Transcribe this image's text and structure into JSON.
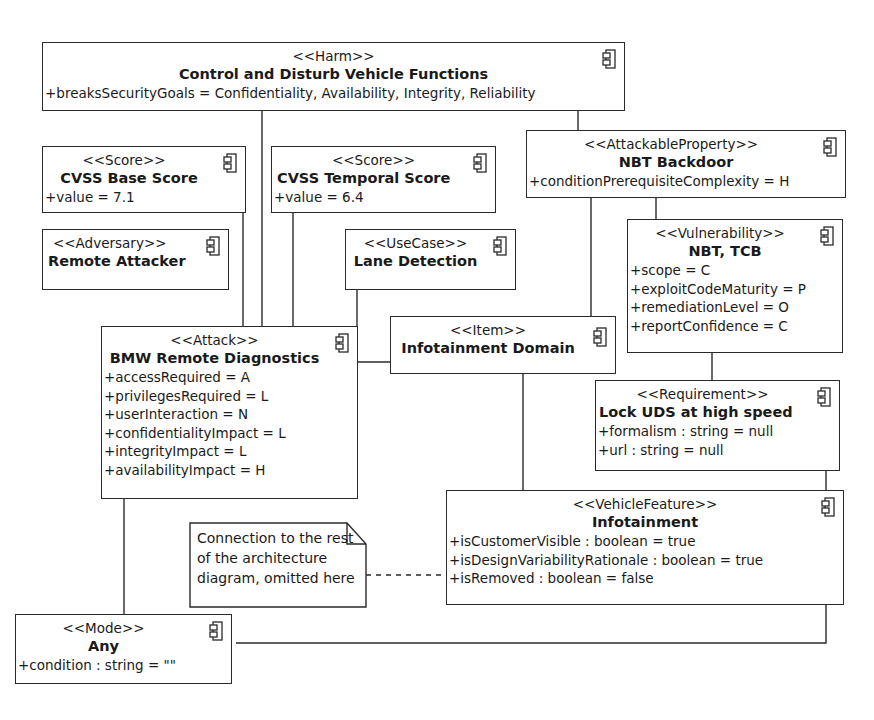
{
  "diagram": {
    "type": "UML component diagram (security / threat model)",
    "elements": {
      "harm": {
        "stereotype": "<<Harm>>",
        "name": "Control and Disturb Vehicle Functions",
        "attributes": [
          "+breaksSecurityGoals = Confidentiality, Availability, Integrity, Reliability"
        ]
      },
      "base_score": {
        "stereotype": "<<Score>>",
        "name": "CVSS Base Score",
        "attributes": [
          "+value = 7.1"
        ]
      },
      "temporal_score": {
        "stereotype": "<<Score>>",
        "name": "CVSS Temporal Score",
        "attributes": [
          "+value = 6.4"
        ]
      },
      "attackable_property": {
        "stereotype": "<<AttackableProperty>>",
        "name": "NBT Backdoor",
        "attributes": [
          "+conditionPrerequisiteComplexity = H"
        ]
      },
      "adversary": {
        "stereotype": "<<Adversary>>",
        "name": "Remote Attacker",
        "attributes": []
      },
      "use_case": {
        "stereotype": "<<UseCase>>",
        "name": "Lane Detection",
        "attributes": []
      },
      "vulnerability": {
        "stereotype": "<<Vulnerability>>",
        "name": "NBT, TCB",
        "attributes": [
          "+scope = C",
          "+exploitCodeMaturity = P",
          "+remediationLevel = O",
          "+reportConfidence = C"
        ]
      },
      "attack": {
        "stereotype": "<<Attack>>",
        "name": "BMW Remote Diagnostics",
        "attributes": [
          "+accessRequired = A",
          "+privilegesRequired = L",
          "+userInteraction = N",
          "+confidentialityImpact = L",
          "+integrityImpact = L",
          "+availabilityImpact = H"
        ]
      },
      "item": {
        "stereotype": "<<Item>>",
        "name": "Infotainment Domain",
        "attributes": []
      },
      "requirement": {
        "stereotype": "<<Requirement>>",
        "name": "Lock UDS at high speed",
        "attributes": [
          "+formalism : string = null",
          "+url : string = null"
        ]
      },
      "vehicle_feature": {
        "stereotype": "<<VehicleFeature>>",
        "name": "Infotainment",
        "attributes": [
          "+isCustomerVisible : boolean = true",
          "+isDesignVariabilityRationale : boolean = true",
          "+isRemoved : boolean = false"
        ]
      },
      "mode": {
        "stereotype": "<<Mode>>",
        "name": "Any",
        "attributes": [
          "+condition : string = \"\""
        ]
      }
    },
    "note": {
      "text": "Connection to the rest\nof the architecture\ndiagram, omitted here"
    },
    "icon": "component-icon",
    "colors": {
      "line": "#2a2a2a",
      "background": "#ffffff",
      "text": "#1a1a1a"
    },
    "connections": [
      [
        "harm",
        "attack"
      ],
      [
        "harm",
        "attackable_property"
      ],
      [
        "base_score",
        "attack"
      ],
      [
        "temporal_score",
        "attack"
      ],
      [
        "adversary",
        "attack"
      ],
      [
        "use_case",
        "attack"
      ],
      [
        "attack",
        "item"
      ],
      [
        "attackable_property",
        "item"
      ],
      [
        "attackable_property",
        "vulnerability"
      ],
      [
        "vulnerability",
        "requirement"
      ],
      [
        "item",
        "vehicle_feature"
      ],
      [
        "attack",
        "mode"
      ],
      [
        "requirement",
        "mode"
      ],
      [
        "note",
        "vehicle_feature",
        "dashed"
      ]
    ]
  }
}
